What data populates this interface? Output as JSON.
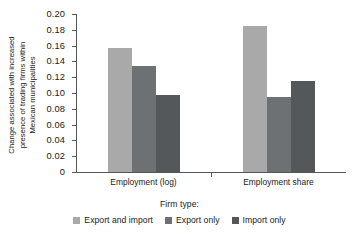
{
  "chart_data": {
    "type": "bar",
    "title": "",
    "xlabel": "Firm type:",
    "ylabel_lines": [
      "Change associated with increased",
      "presence of trading firms within",
      "Mexican municipalities"
    ],
    "ylabel": "Change associated with increased presence of trading firms within Mexican municipalities",
    "categories": [
      "Employment (log)",
      "Employment share"
    ],
    "series": [
      {
        "name": "Export and import",
        "color": "#a9a9a9",
        "values": [
          0.157,
          0.185
        ]
      },
      {
        "name": "Export only",
        "color": "#6e7173",
        "values": [
          0.134,
          0.095
        ]
      },
      {
        "name": "Import only",
        "color": "#55585a",
        "values": [
          0.097,
          0.115
        ]
      }
    ],
    "ylim": [
      0,
      0.2
    ],
    "ytick_values": [
      0,
      0.02,
      0.04,
      0.06,
      0.08,
      0.1,
      0.12,
      0.14,
      0.16,
      0.18,
      0.2
    ],
    "ytick_labels": [
      "0",
      "0.02",
      "0.04",
      "0.06",
      "0.08",
      "0.10",
      "0.12",
      "0.14",
      "0.16",
      "0.18",
      "0.20"
    ],
    "grid": false,
    "legend_position": "bottom",
    "legend_title": "Firm type:"
  }
}
